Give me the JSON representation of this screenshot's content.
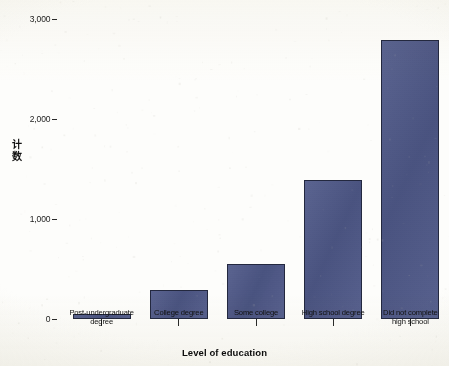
{
  "chart_data": {
    "type": "bar",
    "title": "",
    "xlabel": "Level of education",
    "ylabel": "计数",
    "categories": [
      "Post-undergraduate degree",
      "College degree",
      "Some college",
      "High school degree",
      "Did not complete high school"
    ],
    "category_lines": [
      [
        "Post-undergraduate",
        "degree"
      ],
      [
        "College degree"
      ],
      [
        "Some college"
      ],
      [
        "High school degree"
      ],
      [
        "Did not complete",
        "high school"
      ]
    ],
    "values": [
      50,
      290,
      555,
      1390,
      2790
    ],
    "ylim": [
      0,
      3000
    ],
    "yticks": [
      0,
      1000,
      2000,
      3000
    ],
    "ytick_labels": [
      "0",
      "1,000",
      "2,000",
      "3,000"
    ],
    "grid": false,
    "legend": null,
    "bar_color": "#4d5788",
    "bar_border_color": "#23283f",
    "background_color": "#fdfdfb",
    "text_color": "#101010"
  },
  "axes": {
    "y_title_chars": [
      "计",
      "数"
    ],
    "x_title": "Level of education"
  }
}
